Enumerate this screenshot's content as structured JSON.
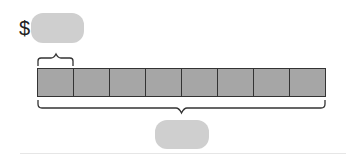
{
  "diagram": {
    "currency_symbol": "$",
    "top_answer_box": {
      "value": "",
      "placeholder": ""
    },
    "bottom_answer_box": {
      "value": "",
      "placeholder": ""
    },
    "tape": {
      "parts": 8,
      "fill_color": "#a6a6a6",
      "border_color": "#333333"
    },
    "colors": {
      "answer_box": "#cfcfcf"
    }
  }
}
